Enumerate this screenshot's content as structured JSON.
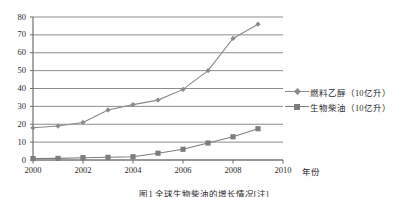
{
  "chart_data": {
    "type": "line",
    "title": "",
    "xlabel": "年份",
    "ylabel": "",
    "x": [
      2000,
      2001,
      2002,
      2003,
      2004,
      2005,
      2006,
      2007,
      2008,
      2009
    ],
    "xlim": [
      2000,
      2010
    ],
    "ylim": [
      0,
      80
    ],
    "xticks": [
      "2000",
      "2002",
      "2004",
      "2006",
      "2008",
      "2010"
    ],
    "xtick_values": [
      2000,
      2002,
      2004,
      2006,
      2008,
      2010
    ],
    "yticks": [
      "0",
      "10",
      "20",
      "30",
      "40",
      "50",
      "60",
      "70",
      "80"
    ],
    "ytick_values": [
      0,
      10,
      20,
      30,
      40,
      50,
      60,
      70,
      80
    ],
    "grid": "horizontal",
    "legend_position": "right",
    "series": [
      {
        "name": "燃料乙醇（10亿升）",
        "marker": "diamond",
        "color": "#8a8a8a",
        "values": [
          18,
          19,
          21,
          28,
          31,
          33.5,
          39.5,
          50,
          68,
          76
        ]
      },
      {
        "name": "生物柴油（10亿升）",
        "marker": "square",
        "color": "#7d7d7d",
        "values": [
          0.8,
          0.9,
          1.3,
          1.5,
          1.8,
          3.8,
          6,
          9.5,
          13,
          17.5
        ]
      }
    ]
  },
  "axis": {
    "x_unit_label": "年份"
  },
  "caption": {
    "text": "图1  全球生物柴油的增长情况[注]"
  }
}
